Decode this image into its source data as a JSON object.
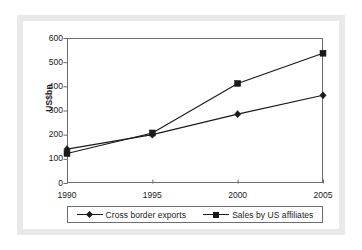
{
  "chart_data": {
    "type": "line",
    "title": "",
    "xlabel": "",
    "ylabel": "US$bn",
    "categories": [
      "1990",
      "1995",
      "2000",
      "2005"
    ],
    "x": [
      1990,
      1995,
      2000,
      2005
    ],
    "ylim": [
      0,
      600
    ],
    "ytick_labels": [
      "0",
      "100",
      "200",
      "300",
      "400",
      "500",
      "600"
    ],
    "yticks": [
      0,
      100,
      200,
      300,
      400,
      500,
      600
    ],
    "grid": false,
    "legend_position": "bottom",
    "series": [
      {
        "name": "Cross border exports",
        "marker": "diamond",
        "color": "#1a1a1a",
        "values": [
          140,
          200,
          285,
          363
        ]
      },
      {
        "name": "Sales by US affiliates",
        "marker": "square",
        "color": "#1a1a1a",
        "values": [
          122,
          207,
          412,
          537
        ]
      }
    ]
  },
  "figure": {
    "frame_color": "#e9e9e9",
    "background_color": "#ffffff",
    "axis_color": "#6d6d6d",
    "text_color": "#1a1a1a"
  }
}
